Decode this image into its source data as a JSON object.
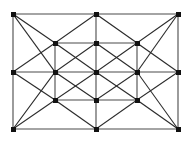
{
  "figure": {
    "type": "graph-diagram",
    "background_color": "#ffffff",
    "width": 193,
    "height": 147
  },
  "style": {
    "edge_color": "#4a4a4a",
    "edge_color_dark": "#2b2b2b",
    "edge_width": 1.1,
    "node_color": "#111111",
    "node_size": 5,
    "node_shape": "square"
  },
  "graph_data": {
    "type": "graph",
    "node_count": 17,
    "edge_count": 44,
    "grid_columns": [
      13,
      55,
      96,
      137,
      178
    ],
    "grid_rows": [
      14,
      43,
      72,
      100,
      129
    ],
    "nodes": [
      {
        "id": "n0",
        "label": "",
        "col": 0,
        "row": 0,
        "x": 13,
        "y": 14
      },
      {
        "id": "n1",
        "label": "",
        "col": 2,
        "row": 0,
        "x": 96,
        "y": 14
      },
      {
        "id": "n2",
        "label": "",
        "col": 4,
        "row": 0,
        "x": 178,
        "y": 14
      },
      {
        "id": "n3",
        "label": "",
        "col": 1,
        "row": 1,
        "x": 55,
        "y": 43
      },
      {
        "id": "n4",
        "label": "",
        "col": 2,
        "row": 1,
        "x": 96,
        "y": 43
      },
      {
        "id": "n5",
        "label": "",
        "col": 3,
        "row": 1,
        "x": 137,
        "y": 43
      },
      {
        "id": "n6",
        "label": "",
        "col": 0,
        "row": 2,
        "x": 13,
        "y": 72
      },
      {
        "id": "n7",
        "label": "",
        "col": 1,
        "row": 2,
        "x": 55,
        "y": 72
      },
      {
        "id": "n8",
        "label": "",
        "col": 2,
        "row": 2,
        "x": 96,
        "y": 72
      },
      {
        "id": "n9",
        "label": "",
        "col": 3,
        "row": 2,
        "x": 137,
        "y": 72
      },
      {
        "id": "n10",
        "label": "",
        "col": 4,
        "row": 2,
        "x": 178,
        "y": 72
      },
      {
        "id": "n11",
        "label": "",
        "col": 1,
        "row": 3,
        "x": 55,
        "y": 100
      },
      {
        "id": "n12",
        "label": "",
        "col": 2,
        "row": 3,
        "x": 96,
        "y": 100
      },
      {
        "id": "n13",
        "label": "",
        "col": 3,
        "row": 3,
        "x": 137,
        "y": 100
      },
      {
        "id": "n14",
        "label": "",
        "col": 0,
        "row": 4,
        "x": 13,
        "y": 129
      },
      {
        "id": "n15",
        "label": "",
        "col": 2,
        "row": 4,
        "x": 96,
        "y": 129
      },
      {
        "id": "n16",
        "label": "",
        "col": 4,
        "row": 4,
        "x": 178,
        "y": 129
      }
    ],
    "edges": [
      {
        "from": "n0",
        "to": "n1",
        "kind": "horizontal"
      },
      {
        "from": "n1",
        "to": "n2",
        "kind": "horizontal"
      },
      {
        "from": "n3",
        "to": "n4",
        "kind": "horizontal"
      },
      {
        "from": "n4",
        "to": "n5",
        "kind": "horizontal"
      },
      {
        "from": "n6",
        "to": "n7",
        "kind": "horizontal"
      },
      {
        "from": "n7",
        "to": "n8",
        "kind": "horizontal"
      },
      {
        "from": "n8",
        "to": "n9",
        "kind": "horizontal"
      },
      {
        "from": "n9",
        "to": "n10",
        "kind": "horizontal"
      },
      {
        "from": "n11",
        "to": "n12",
        "kind": "horizontal"
      },
      {
        "from": "n12",
        "to": "n13",
        "kind": "horizontal"
      },
      {
        "from": "n14",
        "to": "n15",
        "kind": "horizontal"
      },
      {
        "from": "n15",
        "to": "n16",
        "kind": "horizontal"
      },
      {
        "from": "n0",
        "to": "n6",
        "kind": "vertical"
      },
      {
        "from": "n6",
        "to": "n14",
        "kind": "vertical"
      },
      {
        "from": "n3",
        "to": "n7",
        "kind": "vertical"
      },
      {
        "from": "n7",
        "to": "n11",
        "kind": "vertical"
      },
      {
        "from": "n1",
        "to": "n4",
        "kind": "vertical"
      },
      {
        "from": "n4",
        "to": "n8",
        "kind": "vertical"
      },
      {
        "from": "n8",
        "to": "n12",
        "kind": "vertical"
      },
      {
        "from": "n12",
        "to": "n15",
        "kind": "vertical"
      },
      {
        "from": "n5",
        "to": "n9",
        "kind": "vertical"
      },
      {
        "from": "n9",
        "to": "n13",
        "kind": "vertical"
      },
      {
        "from": "n2",
        "to": "n10",
        "kind": "vertical"
      },
      {
        "from": "n10",
        "to": "n16",
        "kind": "vertical"
      },
      {
        "from": "n0",
        "to": "n3",
        "kind": "diagonal"
      },
      {
        "from": "n3",
        "to": "n1",
        "kind": "diagonal"
      },
      {
        "from": "n1",
        "to": "n5",
        "kind": "diagonal"
      },
      {
        "from": "n5",
        "to": "n2",
        "kind": "diagonal"
      },
      {
        "from": "n0",
        "to": "n7",
        "kind": "diagonal"
      },
      {
        "from": "n6",
        "to": "n3",
        "kind": "diagonal"
      },
      {
        "from": "n3",
        "to": "n8",
        "kind": "diagonal"
      },
      {
        "from": "n7",
        "to": "n4",
        "kind": "diagonal"
      },
      {
        "from": "n4",
        "to": "n9",
        "kind": "diagonal"
      },
      {
        "from": "n8",
        "to": "n5",
        "kind": "diagonal"
      },
      {
        "from": "n5",
        "to": "n10",
        "kind": "diagonal"
      },
      {
        "from": "n9",
        "to": "n2",
        "kind": "diagonal"
      },
      {
        "from": "n6",
        "to": "n11",
        "kind": "diagonal"
      },
      {
        "from": "n14",
        "to": "n7",
        "kind": "diagonal"
      },
      {
        "from": "n7",
        "to": "n12",
        "kind": "diagonal"
      },
      {
        "from": "n11",
        "to": "n8",
        "kind": "diagonal"
      },
      {
        "from": "n8",
        "to": "n13",
        "kind": "diagonal"
      },
      {
        "from": "n12",
        "to": "n9",
        "kind": "diagonal"
      },
      {
        "from": "n9",
        "to": "n16",
        "kind": "diagonal"
      },
      {
        "from": "n13",
        "to": "n10",
        "kind": "diagonal"
      },
      {
        "from": "n14",
        "to": "n11",
        "kind": "diagonal"
      },
      {
        "from": "n11",
        "to": "n15",
        "kind": "diagonal"
      },
      {
        "from": "n15",
        "to": "n13",
        "kind": "diagonal"
      },
      {
        "from": "n13",
        "to": "n16",
        "kind": "diagonal"
      }
    ]
  }
}
